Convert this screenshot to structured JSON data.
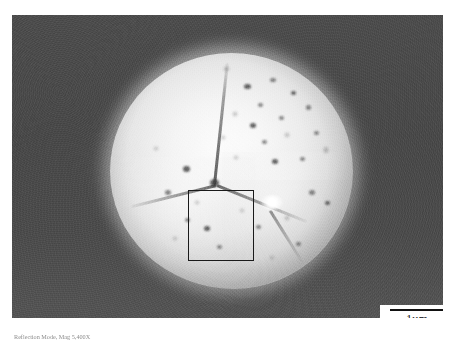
{
  "figure": {
    "type": "sem-micrograph",
    "caption": "Reflection Mode, Mag 5,400X",
    "background_color": "#4a4a4a",
    "particle_color": "#f2f2f2"
  },
  "micrograph": {
    "alt_name": "spherical sintered particle with grain boundaries and surface pores",
    "frame": {
      "x": 12,
      "y": 15,
      "width": 431,
      "height": 303
    }
  },
  "annotations": {
    "roi": {
      "label": "region-of-interest-rectangle",
      "stroke_color": "#1a1a1a",
      "x": 176,
      "y": 175,
      "width": 66,
      "height": 71
    },
    "scalebar": {
      "label": "1µm",
      "bar_color": "#111111",
      "box_color": "#ffffff",
      "bar_length_px": 55
    }
  },
  "features": {
    "grain_boundaries": 4,
    "triple_junction": 1,
    "pores": [
      {
        "x": 55.0,
        "y": 13.0,
        "w": 7,
        "h": 5,
        "style": "deep"
      },
      {
        "x": 66.0,
        "y": 10.5,
        "w": 6,
        "h": 4,
        "style": "pore"
      },
      {
        "x": 74.5,
        "y": 16.0,
        "w": 5,
        "h": 4,
        "style": "deep"
      },
      {
        "x": 61.0,
        "y": 21.0,
        "w": 5,
        "h": 4,
        "style": "pore"
      },
      {
        "x": 50.5,
        "y": 25.0,
        "w": 4,
        "h": 4,
        "style": "soft"
      },
      {
        "x": 57.5,
        "y": 29.5,
        "w": 6,
        "h": 5,
        "style": "deep"
      },
      {
        "x": 69.5,
        "y": 26.5,
        "w": 5,
        "h": 4,
        "style": "pore"
      },
      {
        "x": 80.5,
        "y": 22.0,
        "w": 5,
        "h": 5,
        "style": "pore"
      },
      {
        "x": 45.5,
        "y": 35.0,
        "w": 4,
        "h": 3,
        "style": "soft"
      },
      {
        "x": 62.5,
        "y": 37.0,
        "w": 5,
        "h": 4,
        "style": "pore"
      },
      {
        "x": 72.0,
        "y": 34.0,
        "w": 4,
        "h": 4,
        "style": "soft"
      },
      {
        "x": 84.0,
        "y": 33.0,
        "w": 5,
        "h": 4,
        "style": "pore"
      },
      {
        "x": 51.0,
        "y": 43.5,
        "w": 4,
        "h": 3,
        "style": "soft"
      },
      {
        "x": 66.5,
        "y": 45.0,
        "w": 6,
        "h": 5,
        "style": "deep"
      },
      {
        "x": 78.0,
        "y": 44.0,
        "w": 5,
        "h": 4,
        "style": "pore"
      },
      {
        "x": 88.0,
        "y": 40.0,
        "w": 4,
        "h": 6,
        "style": "soft"
      },
      {
        "x": 30.0,
        "y": 48.0,
        "w": 7,
        "h": 6,
        "style": "deep"
      },
      {
        "x": 22.5,
        "y": 58.0,
        "w": 6,
        "h": 5,
        "style": "pore"
      },
      {
        "x": 35.0,
        "y": 62.5,
        "w": 4,
        "h": 3,
        "style": "soft"
      },
      {
        "x": 31.0,
        "y": 70.0,
        "w": 5,
        "h": 4,
        "style": "pore"
      },
      {
        "x": 38.5,
        "y": 73.5,
        "w": 6,
        "h": 5,
        "style": "deep"
      },
      {
        "x": 26.0,
        "y": 78.0,
        "w": 4,
        "h": 3,
        "style": "soft"
      },
      {
        "x": 44.0,
        "y": 81.5,
        "w": 5,
        "h": 4,
        "style": "pore"
      },
      {
        "x": 53.5,
        "y": 66.0,
        "w": 4,
        "h": 3,
        "style": "soft"
      },
      {
        "x": 60.0,
        "y": 73.0,
        "w": 5,
        "h": 4,
        "style": "pore"
      },
      {
        "x": 72.0,
        "y": 69.0,
        "w": 4,
        "h": 4,
        "style": "soft"
      },
      {
        "x": 82.0,
        "y": 58.0,
        "w": 6,
        "h": 5,
        "style": "pore"
      },
      {
        "x": 88.5,
        "y": 62.5,
        "w": 5,
        "h": 4,
        "style": "deep"
      },
      {
        "x": 76.5,
        "y": 80.0,
        "w": 5,
        "h": 4,
        "style": "pore"
      },
      {
        "x": 66.0,
        "y": 86.0,
        "w": 4,
        "h": 3,
        "style": "soft"
      },
      {
        "x": 18.0,
        "y": 40.0,
        "w": 4,
        "h": 3,
        "style": "soft"
      },
      {
        "x": 47.0,
        "y": 6.0,
        "w": 5,
        "h": 4,
        "style": "soft"
      }
    ]
  }
}
